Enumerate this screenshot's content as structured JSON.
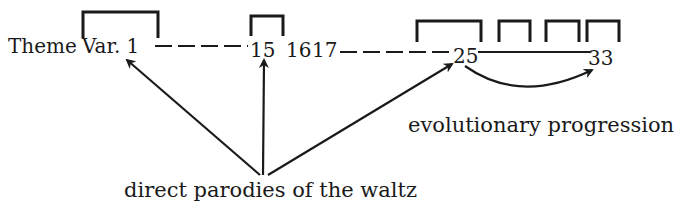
{
  "diagram": {
    "sequence_labels": {
      "theme": "Theme",
      "var1": "Var. 1",
      "v15": "15",
      "v16": "16",
      "v17": "17",
      "v25": "25",
      "v33": "33"
    },
    "annotations": {
      "evolutionary": "evolutionary progression",
      "parodies": "direct parodies of the waltz"
    },
    "brackets_count": 6,
    "ink_color": "#1a1a1a",
    "background": "#ffffff"
  }
}
